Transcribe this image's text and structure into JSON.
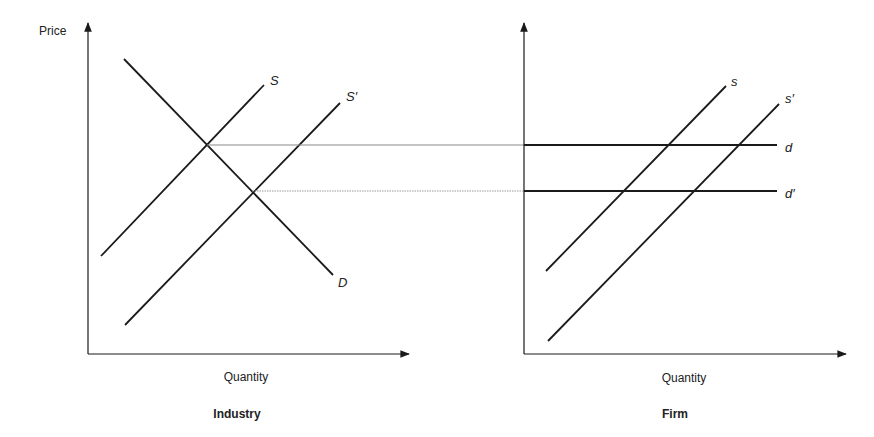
{
  "industry": {
    "title": "Industry",
    "y_axis_label": "Price",
    "x_axis_label": "Quantity",
    "curves": {
      "S": "S",
      "S_prime": "S′",
      "D": "D"
    }
  },
  "firm": {
    "title": "Firm",
    "x_axis_label": "Quantity",
    "curves": {
      "s": "s",
      "s_prime": "s′",
      "d": "d",
      "d_prime": "d′"
    }
  },
  "colors": {
    "line": "#1a1a1a",
    "guide": "#888888",
    "background": "#ffffff"
  }
}
